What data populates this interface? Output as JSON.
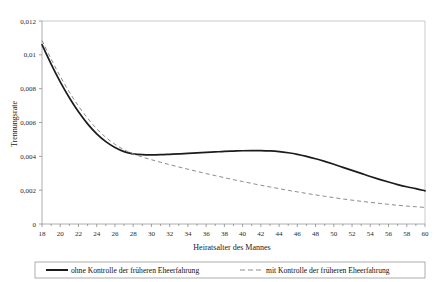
{
  "chart_data": {
    "type": "line",
    "title": "",
    "xlabel": "Heiratsalter des Mannes",
    "ylabel": "Trennungsrate",
    "xlim": [
      18,
      60
    ],
    "ylim": [
      0,
      0.012
    ],
    "grid": false,
    "legend_position": "bottom",
    "x_ticks": [
      18,
      20,
      22,
      24,
      26,
      28,
      30,
      32,
      34,
      36,
      38,
      40,
      42,
      44,
      46,
      48,
      50,
      52,
      54,
      56,
      58,
      60
    ],
    "x_tick_labels": [
      "18",
      "20",
      "22",
      "24",
      "26",
      "28",
      "30",
      "32",
      "34",
      "36",
      "38",
      "40",
      "42",
      "44",
      "46",
      "48",
      "50",
      "52",
      "54",
      "56",
      "58",
      "60"
    ],
    "y_ticks": [
      0,
      0.002,
      0.004,
      0.006,
      0.008,
      0.01,
      0.012
    ],
    "y_tick_labels": [
      "0",
      "0,002",
      "0,004",
      "0,006",
      "0,008",
      "0,01",
      "0,012"
    ],
    "x": [
      18,
      19,
      20,
      21,
      22,
      23,
      24,
      25,
      26,
      27,
      28,
      29,
      30,
      31,
      32,
      33,
      34,
      35,
      36,
      37,
      38,
      39,
      40,
      41,
      42,
      43,
      44,
      45,
      46,
      47,
      48,
      49,
      50,
      51,
      52,
      53,
      54,
      55,
      56,
      57,
      58,
      59,
      60
    ],
    "series": [
      {
        "name": "ohne Kontrolle der früheren Eheerfahrung",
        "style": "solid",
        "color": "#1c1c1c",
        "values": [
          0.0106,
          0.00945,
          0.0084,
          0.00746,
          0.00663,
          0.00592,
          0.00533,
          0.00487,
          0.00452,
          0.00428,
          0.00415,
          0.0041,
          0.00409,
          0.0041,
          0.00412,
          0.00414,
          0.00417,
          0.0042,
          0.00423,
          0.00426,
          0.00429,
          0.00431,
          0.00433,
          0.00434,
          0.00434,
          0.00432,
          0.00428,
          0.00421,
          0.00412,
          0.004,
          0.00386,
          0.0037,
          0.00353,
          0.00335,
          0.00317,
          0.00299,
          0.00281,
          0.00264,
          0.00248,
          0.00233,
          0.0022,
          0.00209,
          0.00196
        ]
      },
      {
        "name": "mit Kontrolle der früheren Eheerfahrung",
        "style": "dashed",
        "color": "#8c8c8c",
        "values": [
          0.01085,
          0.00975,
          0.00873,
          0.0078,
          0.00697,
          0.00625,
          0.00563,
          0.00512,
          0.00471,
          0.00439,
          0.00415,
          0.00396,
          0.0038,
          0.00365,
          0.00351,
          0.00337,
          0.00324,
          0.00311,
          0.00298,
          0.00286,
          0.00274,
          0.00262,
          0.00251,
          0.0024,
          0.00229,
          0.00219,
          0.00209,
          0.00199,
          0.0019,
          0.00181,
          0.00172,
          0.00164,
          0.00156,
          0.00148,
          0.00141,
          0.00134,
          0.00128,
          0.00122,
          0.00116,
          0.00111,
          0.00106,
          0.00102,
          0.00098
        ]
      }
    ],
    "legend": [
      {
        "label": "ohne Kontrolle der früheren Eheerfahrung",
        "style": "solid"
      },
      {
        "label": "mit Kontrolle der früheren Eheerfahrung",
        "style": "dashed"
      }
    ]
  }
}
